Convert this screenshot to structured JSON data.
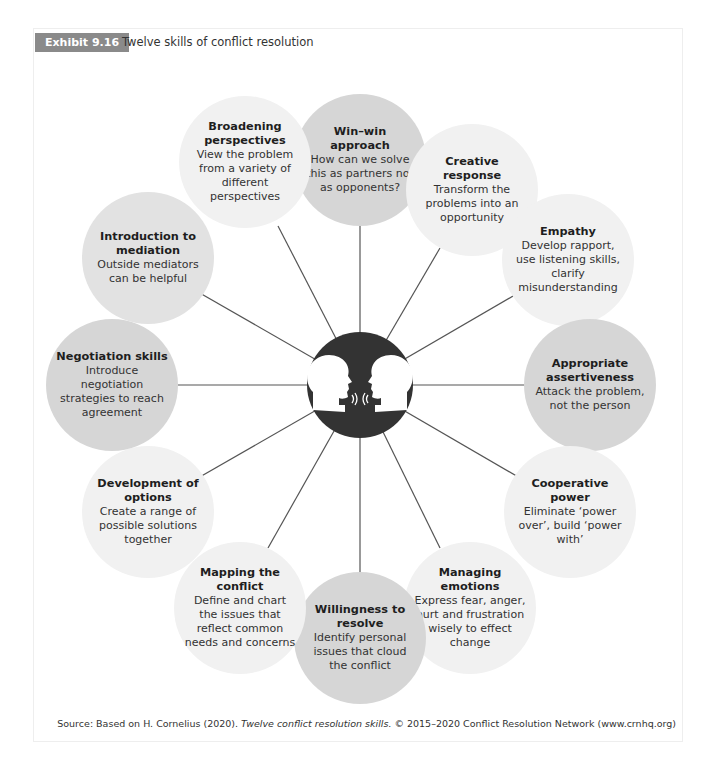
{
  "exhibit": {
    "label": "Exhibit 9.16",
    "title": "Twelve skills of conflict resolution"
  },
  "center": {
    "icon": "two-heads-facing-icon"
  },
  "colors": {
    "dark": "#d6d6d6",
    "mid": "#e2e2e2",
    "light": "#f1f1f1",
    "center": "#333333",
    "badge": "#8a8a8a",
    "spoke": "#555555"
  },
  "skills": [
    {
      "title": "Win–win approach",
      "desc": "How can we solve this as partners not as opponents?",
      "shade": "dark"
    },
    {
      "title": "Creative response",
      "desc": "Transform the problems into an opportunity",
      "shade": "light"
    },
    {
      "title": "Empathy",
      "desc": "Develop rapport, use listening skills, clarify misunderstanding",
      "shade": "light"
    },
    {
      "title": "Appropriate assertiveness",
      "desc": "Attack the problem, not the person",
      "shade": "dark"
    },
    {
      "title": "Cooperative power",
      "desc": "Eliminate ‘power over’, build ‘power with’",
      "shade": "light"
    },
    {
      "title": "Managing emotions",
      "desc": "Express fear, anger, hurt and frustration wisely to effect change",
      "shade": "light"
    },
    {
      "title": "Willingness to resolve",
      "desc": "Identify personal issues that cloud the conflict",
      "shade": "dark"
    },
    {
      "title": "Mapping the conflict",
      "desc": "Define and chart the issues that reflect common needs and concerns",
      "shade": "light"
    },
    {
      "title": "Development of options",
      "desc": "Create a range of possible solutions together",
      "shade": "light"
    },
    {
      "title": "Negotiation skills",
      "desc": "Introduce negotiation strategies to reach agreement",
      "shade": "dark"
    },
    {
      "title": "Introduction to mediation",
      "desc": "Outside mediators can be helpful",
      "shade": "mid"
    },
    {
      "title": "Broadening perspectives",
      "desc": "View the problem from a variety of different perspectives",
      "shade": "light"
    }
  ],
  "source": {
    "prefix": "Source: Based on H. Cornelius (2020). ",
    "work": "Twelve conflict resolution skills.",
    "suffix": " © 2015–2020 Conflict Resolution Network (www.crnhq.org)"
  }
}
